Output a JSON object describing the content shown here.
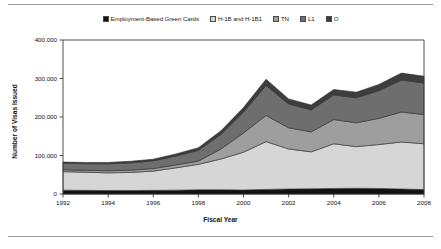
{
  "chart_data": {
    "type": "area",
    "stacked": true,
    "title": "",
    "xlabel": "Fiscal Year",
    "ylabel": "Number of Visas Issued",
    "x": [
      1992,
      1993,
      1994,
      1995,
      1996,
      1997,
      1998,
      1999,
      2000,
      2001,
      2002,
      2003,
      2004,
      2005,
      2006,
      2007,
      2008
    ],
    "xticks": [
      "1992",
      "1994",
      "1996",
      "1998",
      "2000",
      "2002",
      "2004",
      "2006",
      "2008"
    ],
    "yticks": [
      "0",
      "100,000",
      "200,000",
      "300,000",
      "400,000"
    ],
    "ylim": [
      0,
      400000
    ],
    "grid": false,
    "legend_position": "top",
    "series": [
      {
        "name": "Employment-Based Green Cards",
        "color": "#111111",
        "values": [
          10000,
          9500,
          9000,
          9000,
          9500,
          10000,
          11000,
          11000,
          10500,
          12000,
          13000,
          13500,
          14500,
          15000,
          14500,
          13000,
          11500
        ]
      },
      {
        "name": "H-1B and H-1B1",
        "color": "#d6d6d6",
        "values": [
          48000,
          47000,
          46000,
          47000,
          50000,
          58000,
          66000,
          80000,
          98000,
          124000,
          104000,
          96000,
          116000,
          108000,
          114000,
          122000,
          119000
        ]
      },
      {
        "name": "TN",
        "color": "#9e9e9e",
        "values": [
          5000,
          5000,
          5500,
          6000,
          6500,
          7500,
          8500,
          26000,
          50000,
          68000,
          55000,
          52000,
          63000,
          62000,
          68000,
          78000,
          76000
        ]
      },
      {
        "name": "L1",
        "color": "#6e6e6e",
        "values": [
          17000,
          17500,
          18000,
          19000,
          20000,
          23000,
          28000,
          38000,
          54000,
          78000,
          62000,
          57000,
          64000,
          65000,
          72000,
          83000,
          82000
        ]
      },
      {
        "name": "O",
        "color": "#3d3d3d",
        "values": [
          3000,
          3000,
          3500,
          4000,
          4500,
          5500,
          6500,
          9000,
          12000,
          16000,
          13000,
          12500,
          14000,
          14500,
          16000,
          18000,
          17500
        ]
      }
    ]
  }
}
